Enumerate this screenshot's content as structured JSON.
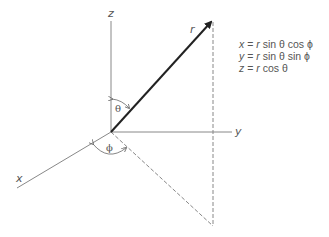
{
  "diagram": {
    "axes": {
      "x_label": "x",
      "y_label": "y",
      "z_label": "z"
    },
    "vector_label": "r",
    "angles": {
      "polar": "θ",
      "azimuth": "ϕ"
    },
    "equations": [
      {
        "lhs": "x",
        "eq": " = ",
        "r": "r",
        "rest": " sin θ cos ϕ"
      },
      {
        "lhs": "y",
        "eq": " = ",
        "r": "r",
        "rest": " sin θ sin ϕ"
      },
      {
        "lhs": "z",
        "eq": " = ",
        "r": "r",
        "rest": " cos θ"
      }
    ],
    "colors": {
      "axis": "#888888",
      "vector": "#222222",
      "dashed": "#888888",
      "text": "#555555"
    }
  }
}
